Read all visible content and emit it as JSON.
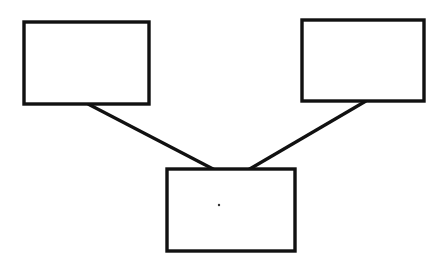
{
  "diagram": {
    "type": "tree",
    "stroke_color": "#111111",
    "background": "#ffffff",
    "nodes": [
      {
        "id": "top-left",
        "label": "",
        "x": 24,
        "y": 22,
        "w": 125,
        "h": 82
      },
      {
        "id": "top-right",
        "label": "",
        "x": 302,
        "y": 20,
        "w": 122,
        "h": 81
      },
      {
        "id": "bottom-center",
        "label": "",
        "x": 167,
        "y": 169,
        "w": 128,
        "h": 82
      }
    ],
    "edges": [
      {
        "from": "top-left",
        "to": "bottom-center",
        "x1": 88,
        "y1": 104,
        "x2": 215,
        "y2": 170
      },
      {
        "from": "top-right",
        "to": "bottom-center",
        "x1": 366,
        "y1": 101,
        "x2": 248,
        "y2": 170
      }
    ],
    "marks": [
      {
        "type": "dot",
        "x": 219,
        "y": 205,
        "r": 1.2
      }
    ]
  }
}
